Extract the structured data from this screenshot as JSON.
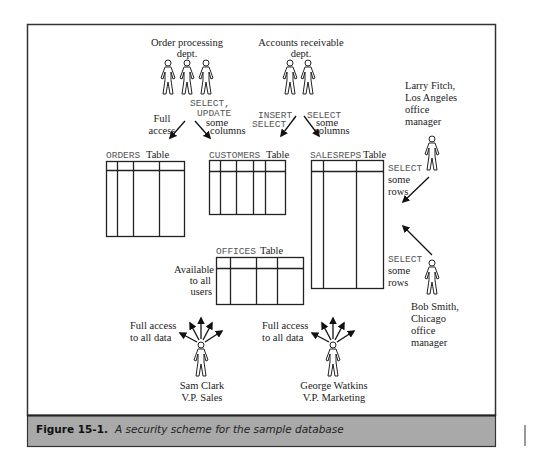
{
  "groups": {
    "order_processing": {
      "label_lines": [
        "Order processing",
        "dept."
      ],
      "people_count": 3
    },
    "accounts_receivable": {
      "label_lines": [
        "Accounts receivable",
        "dept."
      ],
      "people_count": 2
    }
  },
  "people": {
    "larry": {
      "label_lines": [
        "Larry Fitch,",
        "Los Angeles",
        "office",
        "manager"
      ]
    },
    "bob": {
      "label_lines": [
        "Bob Smith,",
        "Chicago",
        "office",
        "manager"
      ]
    },
    "sam": {
      "label_lines": [
        "Sam Clark",
        "V.P. Sales"
      ]
    },
    "george": {
      "label_lines": [
        "George Watkins",
        "V.P. Marketing"
      ]
    }
  },
  "privileges": {
    "order_full": [
      "Full",
      "access"
    ],
    "order_select_update": {
      "code": [
        "SELECT,",
        "UPDATE"
      ],
      "text": [
        "some",
        "columns"
      ]
    },
    "ar_insert_select": {
      "code": [
        "INSERT,",
        "SELECT"
      ]
    },
    "ar_select_some": {
      "code": [
        "SELECT"
      ],
      "text": [
        "some",
        "columns"
      ]
    },
    "larry_select": {
      "code": [
        "SELECT"
      ],
      "text": [
        "some",
        "rows"
      ]
    },
    "bob_select": {
      "code": [
        "SELECT"
      ],
      "text": [
        "some",
        "rows"
      ]
    },
    "offices_available": [
      "Available",
      "to all",
      "users"
    ],
    "sam_full": [
      "Full access",
      "to all data"
    ],
    "george_full": [
      "Full access",
      "to all data"
    ]
  },
  "tables": {
    "orders": {
      "name": "ORDERS",
      "suffix": "Table"
    },
    "customers": {
      "name": "CUSTOMERS",
      "suffix": "Table"
    },
    "salesreps": {
      "name": "SALESREPS",
      "suffix": "Table"
    },
    "offices": {
      "name": "OFFICES",
      "suffix": "Table"
    }
  },
  "caption": {
    "number": "Figure 15-1.",
    "text": "A security scheme for the sample database"
  },
  "colors": {
    "caption_band": "#a9a9a9",
    "frame": "#333333"
  }
}
